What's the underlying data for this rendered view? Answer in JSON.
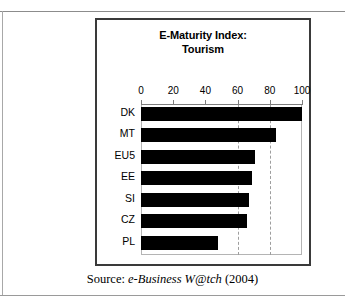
{
  "figure": {
    "caption_prefix": "Source:",
    "caption_italic": "e-Business W@tch",
    "caption_year": "(2004)"
  },
  "chart_data": {
    "type": "bar",
    "orientation": "horizontal",
    "title": "E-Maturity Index:",
    "subtitle": "Tourism",
    "categories": [
      "DK",
      "MT",
      "EU5",
      "EE",
      "SI",
      "CZ",
      "PL"
    ],
    "values": [
      100,
      84,
      71,
      69,
      67,
      66,
      48
    ],
    "xlabel": "",
    "ylabel": "",
    "xlim": [
      0,
      100
    ],
    "xticks": [
      0,
      20,
      40,
      60,
      80,
      100
    ],
    "xtick_labels": [
      "0",
      "20",
      "40",
      "60",
      "80",
      "100"
    ],
    "gridlines_dashed_at": [
      60,
      80
    ],
    "grid": true,
    "legend": "none",
    "bar_color": "#000000"
  }
}
